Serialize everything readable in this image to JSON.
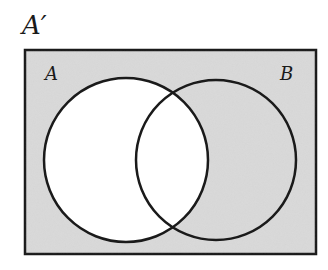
{
  "title": "A′",
  "diagram": {
    "type": "venn",
    "universe_shaded": true,
    "sets": [
      {
        "label": "A",
        "shaded": false
      },
      {
        "label": "B",
        "shaded": true
      }
    ],
    "shaded_region": "A′ (complement of A)",
    "colors": {
      "shade": "#d9d9d9",
      "stroke": "#1a1a1a",
      "unshaded": "#ffffff"
    }
  }
}
